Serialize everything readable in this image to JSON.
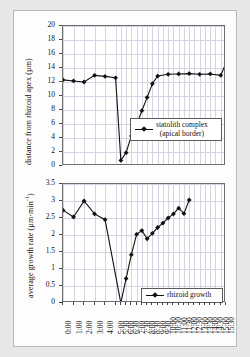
{
  "figure": {
    "background": "#e8e8e8",
    "panel_background": "#ffffff",
    "series_color": "#111111",
    "grid_color": "#d4d4e2"
  },
  "chart_data": [
    {
      "type": "line",
      "title": "",
      "xlabel": "",
      "ylabel": "distance from rhizoid apex (µm)",
      "ylabel_text": "distance from rhizoid apex",
      "ylabel_units": "(µm)",
      "ylim": [
        0,
        20
      ],
      "yticks": [
        "0",
        "2",
        "4",
        "6",
        "8",
        "10",
        "12",
        "14",
        "16",
        "18",
        "20"
      ],
      "ytick_values": [
        0,
        2,
        4,
        6,
        8,
        10,
        12,
        14,
        16,
        18,
        20
      ],
      "grid": true,
      "legend_position": "inside-lower-right",
      "legend": [
        {
          "label_line1": "statolith complex",
          "label_line2": "(apical border)",
          "marker": "diamond",
          "color": "#111111"
        }
      ],
      "categories": [
        "0:00",
        "1:00",
        "2:00",
        "3:00",
        "4:00",
        "5:00",
        "5:30",
        "6:00",
        "6:30",
        "7:00",
        "7:30",
        "8:00",
        "8:30",
        "9:00",
        "9:30",
        "10:00",
        "10:30",
        "11:00",
        "11:30",
        "12:00",
        "12:30",
        "13:00",
        "13:30",
        "14:00",
        "14:30",
        "15:00",
        "15:30"
      ],
      "x": [
        0,
        1,
        2,
        3,
        4,
        5,
        5.5,
        6,
        6.5,
        7,
        7.5,
        8,
        8.5,
        9,
        9.5,
        10,
        10.5,
        11,
        11.5,
        12,
        12.5,
        13,
        13.5,
        14,
        14.5,
        15,
        15.5
      ],
      "series": [
        {
          "name": "statolith complex (apical border)",
          "values": [
            12.3,
            12.15,
            12.0,
            12.95,
            12.8,
            12.6,
            0.8,
            1.9,
            4.3,
            5.9,
            7.9,
            9.8,
            11.75,
            12.85,
            13.1,
            13.15,
            13.2,
            13.1,
            13.15,
            12.95,
            14.7,
            null,
            null,
            null,
            null,
            null,
            null
          ]
        }
      ],
      "plotted_points": [
        {
          "x": "0:00",
          "y": 12.3
        },
        {
          "x": "1:00",
          "y": 12.15
        },
        {
          "x": "2:00",
          "y": 12.0
        },
        {
          "x": "3:00",
          "y": 12.95
        },
        {
          "x": "4:00",
          "y": 12.8
        },
        {
          "x": "5:00",
          "y": 12.6
        },
        {
          "x": "5:30",
          "y": 0.8
        },
        {
          "x": "6:00",
          "y": 1.9
        },
        {
          "x": "6:30",
          "y": 4.3
        },
        {
          "x": "7:00",
          "y": 5.9
        },
        {
          "x": "7:30",
          "y": 7.9
        },
        {
          "x": "8:00",
          "y": 9.8
        },
        {
          "x": "8:30",
          "y": 11.75
        },
        {
          "x": "9:00",
          "y": 12.85
        },
        {
          "x": "10:00",
          "y": 13.1
        },
        {
          "x": "11:00",
          "y": 13.15
        },
        {
          "x": "12:00",
          "y": 13.2
        },
        {
          "x": "13:00",
          "y": 13.1
        },
        {
          "x": "14:00",
          "y": 13.15
        },
        {
          "x": "15:00",
          "y": 12.95
        },
        {
          "x": "15:30",
          "y": 14.7
        }
      ]
    },
    {
      "type": "line",
      "title": "",
      "xlabel": "",
      "ylabel": "average growth rate (µm·min⁻¹)",
      "ylabel_text": "average growth rate",
      "ylabel_units": "(µm·min",
      "ylabel_exp": "-1",
      "ylim": [
        0,
        3.5
      ],
      "yticks": [
        "0",
        "0.5",
        "1",
        "1.5",
        "2",
        "2.5",
        "3",
        "3.5"
      ],
      "ytick_values": [
        0,
        0.5,
        1,
        1.5,
        2,
        2.5,
        3,
        3.5
      ],
      "grid": true,
      "legend_position": "inside-lower-right",
      "legend": [
        {
          "label_line1": "rhizoid growth",
          "label_line2": "",
          "marker": "diamond",
          "color": "#111111"
        }
      ],
      "categories": [
        "0:00",
        "1:00",
        "2:00",
        "3:00",
        "4:00",
        "5:00",
        "5:30",
        "6:00",
        "6:30",
        "7:00",
        "7:30",
        "8:00",
        "8:30",
        "9:00",
        "9:30",
        "10:00",
        "10:30",
        "11:00",
        "11:30",
        "12:00",
        "12:30",
        "13:00",
        "13:30",
        "14:00",
        "14:30",
        "15:00",
        "15:30"
      ],
      "x": [
        0,
        1,
        2,
        3,
        4,
        5,
        5.5,
        6,
        6.5,
        7,
        7.5,
        8,
        8.5,
        9,
        9.5,
        10,
        10.5,
        11,
        11.5,
        12,
        12.5,
        13,
        13.5,
        14,
        14.5,
        15,
        15.5
      ],
      "series": [
        {
          "name": "rhizoid growth",
          "values": [
            2.73,
            2.53,
            3.0,
            2.62,
            2.45,
            0.0,
            0.72,
            1.42,
            2.02,
            2.13,
            1.89,
            2.05,
            2.22,
            2.35,
            2.5,
            2.62,
            2.79,
            2.63,
            3.03
          ]
        }
      ],
      "plotted_points": [
        {
          "x": "0:00",
          "y": 2.73
        },
        {
          "x": "1:00",
          "y": 2.53
        },
        {
          "x": "2:00",
          "y": 3.0
        },
        {
          "x": "3:00",
          "y": 2.62
        },
        {
          "x": "4:00",
          "y": 2.45
        },
        {
          "x": "5:30",
          "y": 0.0
        },
        {
          "x": "6:00",
          "y": 0.72
        },
        {
          "x": "6:30",
          "y": 1.42
        },
        {
          "x": "7:00",
          "y": 2.02
        },
        {
          "x": "7:30",
          "y": 2.13
        },
        {
          "x": "8:00",
          "y": 1.89
        },
        {
          "x": "8:30",
          "y": 2.05
        },
        {
          "x": "9:00",
          "y": 2.22
        },
        {
          "x": "9:30",
          "y": 2.35
        },
        {
          "x": "10:00",
          "y": 2.5
        },
        {
          "x": "10:30",
          "y": 2.62
        },
        {
          "x": "11:00",
          "y": 2.79
        },
        {
          "x": "11:30",
          "y": 2.63
        },
        {
          "x": "12:00",
          "y": 3.03
        }
      ]
    }
  ],
  "xaxis": {
    "ticks": [
      "0:00",
      "1:00",
      "2:00",
      "3:00",
      "4:00",
      "5:00",
      "5:30",
      "6:00",
      "6:30",
      "7:00",
      "7:30",
      "8:00",
      "8:30",
      "9:00",
      "9:30",
      "10:00",
      "10:30",
      "11:00",
      "11:30",
      "12:00",
      "12:30",
      "13:00",
      "13:30",
      "14:00",
      "14:30",
      "15:00",
      "15:30"
    ]
  }
}
